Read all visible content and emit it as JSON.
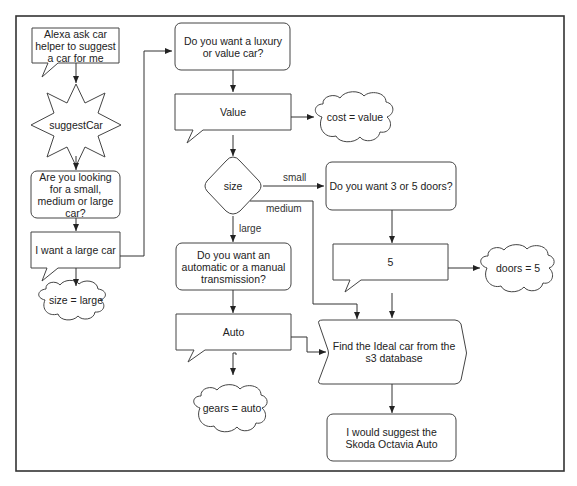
{
  "diagram": {
    "type": "flowchart",
    "colors": {
      "stroke": "#444444",
      "frame": "#333333",
      "fill": "#ffffff",
      "text": "#222222"
    },
    "nodes": {
      "alexa_request": {
        "shape": "speech-callout",
        "text": "Alexa ask car helper to suggest a car for me"
      },
      "suggest_car": {
        "shape": "star",
        "text": "suggestCar"
      },
      "ask_size": {
        "shape": "rounded-rect",
        "text": "Are you looking for a small, medium or large car?"
      },
      "answer_size": {
        "shape": "speech-callout",
        "text": "I want a large car"
      },
      "slot_size": {
        "shape": "cloud",
        "text": "size = large"
      },
      "ask_cost": {
        "shape": "rounded-rect",
        "text": "Do you want a luxury or value car?"
      },
      "answer_cost": {
        "shape": "speech-callout",
        "text": "Value"
      },
      "slot_cost": {
        "shape": "cloud",
        "text": "cost = value"
      },
      "size_decision": {
        "shape": "diamond",
        "text": "size"
      },
      "ask_doors": {
        "shape": "rounded-rect",
        "text": "Do you want 3 or 5 doors?"
      },
      "answer_doors": {
        "shape": "speech-callout",
        "text": "5"
      },
      "slot_doors": {
        "shape": "cloud",
        "text": "doors = 5"
      },
      "ask_gears": {
        "shape": "rounded-rect",
        "text": "Do you want an automatic or a manual transmission?"
      },
      "answer_gears": {
        "shape": "speech-callout",
        "text": "Auto"
      },
      "slot_gears": {
        "shape": "cloud",
        "text": "gears = auto"
      },
      "find_car": {
        "shape": "step",
        "text": "Find the Ideal car from the s3 database"
      },
      "suggestion": {
        "shape": "rounded-rect",
        "text": "I would suggest the Skoda Octavia Auto"
      }
    },
    "edge_labels": {
      "small": "small",
      "medium": "medium",
      "large": "large"
    },
    "edges": [
      {
        "from": "alexa_request",
        "to": "suggest_car"
      },
      {
        "from": "suggest_car",
        "to": "ask_size"
      },
      {
        "from": "ask_size",
        "to": "answer_size"
      },
      {
        "from": "answer_size",
        "to": "slot_size"
      },
      {
        "from": "answer_size",
        "to": "ask_cost"
      },
      {
        "from": "ask_cost",
        "to": "answer_cost"
      },
      {
        "from": "answer_cost",
        "to": "slot_cost"
      },
      {
        "from": "answer_cost",
        "to": "size_decision"
      },
      {
        "from": "size_decision",
        "to": "ask_doors",
        "label": "small"
      },
      {
        "from": "size_decision",
        "to": "find_car",
        "label": "medium"
      },
      {
        "from": "size_decision",
        "to": "ask_gears",
        "label": "large"
      },
      {
        "from": "ask_doors",
        "to": "answer_doors"
      },
      {
        "from": "answer_doors",
        "to": "slot_doors"
      },
      {
        "from": "answer_doors",
        "to": "find_car"
      },
      {
        "from": "ask_gears",
        "to": "answer_gears"
      },
      {
        "from": "answer_gears",
        "to": "slot_gears"
      },
      {
        "from": "answer_gears",
        "to": "find_car"
      },
      {
        "from": "find_car",
        "to": "suggestion"
      }
    ]
  }
}
